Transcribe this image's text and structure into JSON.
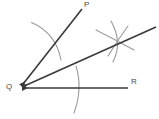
{
  "figure": {
    "background_color": "#ffffff",
    "ray_color": "#3a3a3a",
    "arc_color": "#9a9a9a",
    "label_color": "#4a4a4a"
  },
  "labels": {
    "p": "P",
    "q": "Q",
    "r": "R"
  },
  "points": {
    "vertex": {
      "name": "Q",
      "x": 19,
      "y": 88
    },
    "p_end": {
      "name": "P",
      "x": 82,
      "y": 9
    },
    "r_end": {
      "name": "R",
      "x": 128,
      "y": 88
    },
    "bisector_end": {
      "x": 156,
      "y": 27
    },
    "arc_intersection": {
      "x": 118,
      "y": 41
    }
  },
  "rays": [
    {
      "name": "ray-QP",
      "from": "Q",
      "to": "P",
      "arrowhead_at": "Q"
    },
    {
      "name": "ray-QR",
      "from": "Q",
      "to": "R",
      "arrowhead_at": "Q"
    },
    {
      "name": "ray-bisector",
      "from": "Q",
      "to": "arc-intersection",
      "arrowhead_at": "Q"
    }
  ],
  "arcs": [
    {
      "name": "arc-near-vertex-upper",
      "center": "Q",
      "radius": 55,
      "note": "crosses ray QP"
    },
    {
      "name": "arc-near-vertex-lower",
      "center": "Q",
      "radius": 55,
      "note": "crosses ray QR"
    },
    {
      "name": "arc-far-upper",
      "center": "Q",
      "radius": 113,
      "note": "long arc across bisector"
    },
    {
      "name": "arc-from-p-side",
      "note": "short arc crossing at intersection"
    },
    {
      "name": "arc-from-r-side",
      "note": "short arc crossing at intersection"
    }
  ]
}
